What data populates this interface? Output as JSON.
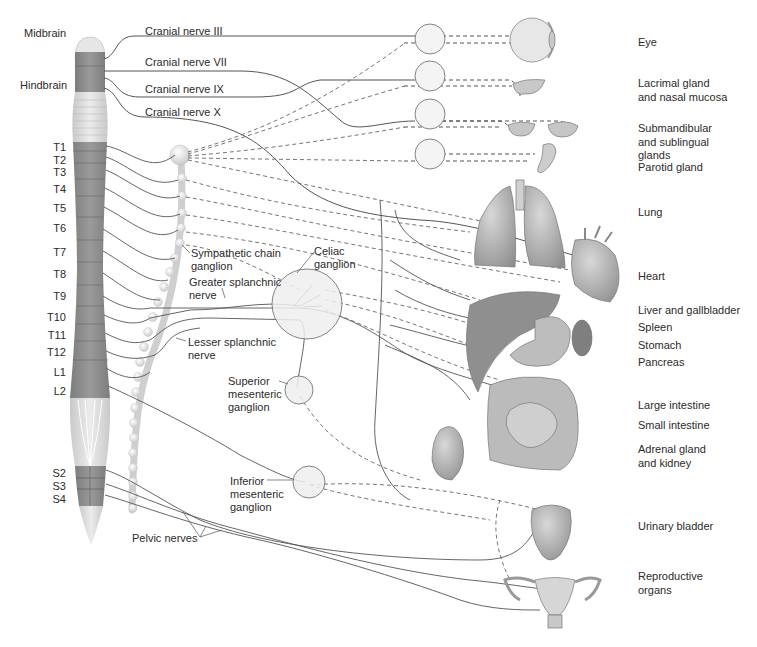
{
  "diagram": {
    "colors": {
      "nerve_line": "#555555",
      "cord_dark": "#8a8a8a",
      "cord_light": "#dcdcdc",
      "ganglion_fill": "#ededed",
      "organ_fill": "#b9b9b9",
      "text": "#2b2b2b"
    },
    "brain_labels": {
      "midbrain": "Midbrain",
      "hindbrain": "Hindbrain"
    },
    "cranial_nerves": [
      {
        "id": "iii",
        "label": "Cranial nerve III"
      },
      {
        "id": "vii",
        "label": "Cranial nerve VII"
      },
      {
        "id": "ix",
        "label": "Cranial nerve IX"
      },
      {
        "id": "x",
        "label": "Cranial nerve X"
      }
    ],
    "spinal_segments": [
      {
        "label": "T1"
      },
      {
        "label": "T2"
      },
      {
        "label": "T3"
      },
      {
        "label": "T4"
      },
      {
        "label": "T5"
      },
      {
        "label": "T6"
      },
      {
        "label": "T7"
      },
      {
        "label": "T8"
      },
      {
        "label": "T9"
      },
      {
        "label": "T10"
      },
      {
        "label": "T11"
      },
      {
        "label": "T12"
      },
      {
        "label": "L1"
      },
      {
        "label": "L2"
      },
      {
        "label": "S2"
      },
      {
        "label": "S3"
      },
      {
        "label": "S4"
      }
    ],
    "structure_labels": {
      "sympathetic_chain": "Sympathetic chain\nganglion",
      "greater_splanchnic": "Greater splanchnic\nnerve",
      "lesser_splanchnic": "Lesser splanchnic\nnerve",
      "celiac": "Celiac\nganglion",
      "superior_mesenteric": "Superior\nmesenteric\nganglion",
      "inferior_mesenteric": "Inferior\nmesenteric\nganglion",
      "pelvic_nerves": "Pelvic nerves"
    },
    "organs": [
      {
        "label": "Eye"
      },
      {
        "label": "Lacrimal gland\nand nasal mucosa"
      },
      {
        "label": "Submandibular\nand sublingual\nglands"
      },
      {
        "label": "Parotid gland"
      },
      {
        "label": "Lung"
      },
      {
        "label": "Heart"
      },
      {
        "label": "Liver and gallbladder"
      },
      {
        "label": "Spleen"
      },
      {
        "label": "Stomach"
      },
      {
        "label": "Pancreas"
      },
      {
        "label": "Large intestine"
      },
      {
        "label": "Small intestine"
      },
      {
        "label": "Adrenal gland\nand kidney"
      },
      {
        "label": "Urinary bladder"
      },
      {
        "label": "Reproductive\norgans"
      }
    ]
  }
}
